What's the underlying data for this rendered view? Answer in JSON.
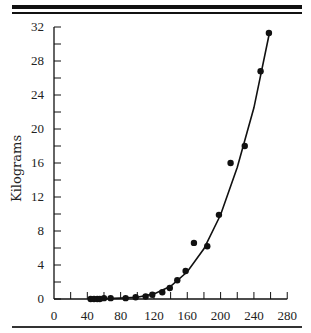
{
  "chart_data": {
    "type": "scatter",
    "title": "",
    "xlabel": "",
    "ylabel": "Kilograms",
    "xlim": [
      0,
      280
    ],
    "ylim": [
      0,
      32
    ],
    "x_ticks": [
      0,
      40,
      80,
      120,
      160,
      200,
      240,
      280
    ],
    "y_ticks": [
      0,
      4,
      8,
      12,
      16,
      20,
      24,
      28,
      32
    ],
    "grid": false,
    "legend": null,
    "series": [
      {
        "name": "observed",
        "kind": "points",
        "x": [
          44,
          48,
          52,
          55,
          60,
          68,
          86,
          98,
          110,
          118,
          130,
          139,
          148,
          158,
          168,
          184,
          198,
          212,
          229,
          248,
          258
        ],
        "y": [
          0,
          0,
          0,
          0,
          0.1,
          0.1,
          0.1,
          0.2,
          0.3,
          0.5,
          0.8,
          1.3,
          2.2,
          3.3,
          6.6,
          6.2,
          9.9,
          16.0,
          18.0,
          26.8,
          31.3
        ]
      },
      {
        "name": "fitted curve",
        "kind": "line",
        "x": [
          44,
          80,
          100,
          120,
          140,
          160,
          180,
          200,
          220,
          240,
          258
        ],
        "y": [
          0,
          0.1,
          0.2,
          0.6,
          1.5,
          3.2,
          5.9,
          9.9,
          15.5,
          22.5,
          31.0
        ]
      }
    ]
  }
}
